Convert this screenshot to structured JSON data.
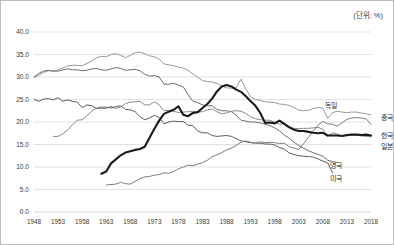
{
  "unit_note": "(단위: %)",
  "chart_data": {
    "type": "line",
    "title": "",
    "subtitle": "",
    "xlabel": "",
    "ylabel": "",
    "unit": "%",
    "xlim": [
      1948,
      2018
    ],
    "ylim": [
      0.0,
      40.0
    ],
    "grid": true,
    "legend_position": "inline-right",
    "x_ticks": [
      "1948",
      "1953",
      "1958",
      "1963",
      "1968",
      "1973",
      "1978",
      "1983",
      "1988",
      "1993",
      "1998",
      "2003",
      "2008",
      "2013",
      "2018"
    ],
    "y_ticks": [
      "0.0",
      "5.0",
      "10.0",
      "15.0",
      "20.0",
      "25.0",
      "30.0",
      "35.0",
      "40.0"
    ],
    "series": [
      {
        "name": "독일",
        "label": "독일",
        "color": "#9a9a9a",
        "width": 1.0,
        "emphasis": false,
        "x": [
          1948,
          1949,
          1950,
          1951,
          1952,
          1953,
          1954,
          1955,
          1956,
          1957,
          1958,
          1959,
          1960,
          1961,
          1962,
          1963,
          1964,
          1965,
          1966,
          1967,
          1968,
          1969,
          1970,
          1971,
          1972,
          1973,
          1974,
          1975,
          1976,
          1977,
          1978,
          1979,
          1980,
          1981,
          1982,
          1983,
          1984,
          1985,
          1986,
          1987,
          1988,
          1989,
          1990,
          1991,
          1992,
          1993,
          1994,
          1995,
          1996,
          1997,
          1998,
          1999,
          2000,
          2001,
          2002,
          2003,
          2004,
          2005,
          2006,
          2007,
          2008,
          2009,
          2010,
          2011,
          2012,
          2013,
          2014,
          2015,
          2016,
          2017,
          2018
        ],
        "y": [
          29.9,
          30.4,
          31.0,
          31.4,
          31.3,
          31.6,
          32.0,
          32.5,
          32.6,
          32.6,
          32.5,
          33.0,
          33.6,
          34.3,
          34.6,
          34.5,
          35.0,
          35.2,
          34.8,
          34.3,
          34.8,
          35.4,
          35.5,
          35.2,
          34.7,
          34.5,
          34.0,
          32.9,
          32.7,
          32.5,
          32.2,
          32.0,
          31.5,
          30.7,
          29.9,
          29.2,
          29.0,
          28.9,
          28.6,
          28.0,
          27.6,
          27.5,
          27.6,
          29.5,
          27.3,
          25.6,
          25.0,
          24.8,
          24.5,
          24.4,
          24.3,
          24.0,
          23.9,
          23.7,
          23.2,
          22.6,
          22.5,
          22.6,
          23.0,
          23.2,
          23.1,
          20.8,
          22.1,
          22.4,
          22.2,
          22.1,
          22.2,
          22.2,
          22.0,
          21.8,
          21.6
        ]
      },
      {
        "name": "영국",
        "label": "영국",
        "color": "#6e6e6e",
        "width": 1.0,
        "emphasis": false,
        "x": [
          1948,
          1949,
          1950,
          1951,
          1952,
          1953,
          1954,
          1955,
          1956,
          1957,
          1958,
          1959,
          1960,
          1961,
          1962,
          1963,
          1964,
          1965,
          1966,
          1967,
          1968,
          1969,
          1970,
          1971,
          1972,
          1973,
          1974,
          1975,
          1976,
          1977,
          1978,
          1979,
          1980,
          1981,
          1982,
          1983,
          1984,
          1985,
          1986,
          1987,
          1988,
          1989,
          1990,
          1991,
          1992,
          1993,
          1994,
          1995,
          1996,
          1997,
          1998,
          1999,
          2000,
          2001,
          2002,
          2003,
          2004,
          2005,
          2006,
          2007,
          2008,
          2009,
          2010,
          2011
        ],
        "y": [
          30.0,
          30.8,
          31.3,
          31.5,
          31.3,
          31.3,
          31.6,
          31.8,
          31.6,
          31.6,
          31.4,
          31.5,
          31.8,
          31.9,
          31.6,
          31.5,
          31.8,
          32.1,
          31.9,
          31.5,
          31.6,
          31.7,
          31.4,
          30.6,
          30.2,
          30.3,
          30.0,
          28.4,
          28.4,
          28.6,
          28.2,
          27.8,
          26.1,
          24.6,
          24.3,
          23.8,
          23.6,
          23.6,
          22.8,
          22.5,
          22.5,
          22.3,
          21.5,
          20.4,
          20.2,
          20.0,
          20.0,
          19.8,
          19.5,
          19.2,
          18.7,
          18.0,
          17.1,
          16.4,
          15.5,
          14.8,
          14.2,
          13.6,
          13.2,
          12.8,
          12.4,
          11.5,
          11.2,
          11.0
        ]
      },
      {
        "name": "일본",
        "label": "일본",
        "color": "#8a8a8a",
        "width": 1.0,
        "emphasis": false,
        "x": [
          1952,
          1953,
          1954,
          1955,
          1956,
          1957,
          1958,
          1959,
          1960,
          1961,
          1962,
          1963,
          1964,
          1965,
          1966,
          1967,
          1968,
          1969,
          1970,
          1971,
          1972,
          1973,
          1974,
          1975,
          1976,
          1977,
          1978,
          1979,
          1980,
          1981,
          1982,
          1983,
          1984,
          1985,
          1986,
          1987,
          1988,
          1989,
          1990,
          1991,
          1992,
          1993,
          1994,
          1995,
          1996,
          1997,
          1998,
          1999,
          2000,
          2001,
          2002,
          2003,
          2004,
          2005,
          2006,
          2007,
          2008,
          2009,
          2010,
          2011,
          2012,
          2013,
          2014,
          2015,
          2016,
          2017,
          2018
        ],
        "y": [
          16.8,
          16.8,
          17.4,
          18.2,
          19.4,
          20.4,
          20.5,
          21.4,
          22.4,
          23.1,
          23.0,
          23.0,
          23.5,
          23.0,
          23.3,
          24.1,
          24.4,
          24.5,
          24.6,
          23.8,
          23.8,
          24.5,
          23.8,
          22.5,
          22.6,
          22.4,
          22.1,
          22.2,
          22.3,
          22.4,
          22.2,
          22.3,
          22.7,
          22.9,
          22.3,
          21.8,
          22.0,
          22.4,
          22.5,
          22.4,
          21.9,
          21.2,
          20.7,
          20.5,
          20.4,
          20.4,
          19.9,
          19.5,
          19.6,
          19.0,
          18.6,
          18.5,
          18.6,
          18.6,
          18.7,
          18.8,
          18.4,
          16.8,
          17.6,
          17.3,
          16.9,
          16.9,
          17.1,
          17.1,
          16.9,
          16.8,
          16.7
        ]
      },
      {
        "name": "미국",
        "label": "미국",
        "color": "#5c5c5c",
        "width": 1.0,
        "emphasis": false,
        "x": [
          1948,
          1949,
          1950,
          1951,
          1952,
          1953,
          1954,
          1955,
          1956,
          1957,
          1958,
          1959,
          1960,
          1961,
          1962,
          1963,
          1964,
          1965,
          1966,
          1967,
          1968,
          1969,
          1970,
          1971,
          1972,
          1973,
          1974,
          1975,
          1976,
          1977,
          1978,
          1979,
          1980,
          1981,
          1982,
          1983,
          1984,
          1985,
          1986,
          1987,
          1988,
          1989,
          1990,
          1991,
          1992,
          1993,
          1994,
          1995,
          1996,
          1997,
          1998,
          1999,
          2000,
          2001,
          2002,
          2003,
          2004,
          2005,
          2006,
          2007,
          2008,
          2009,
          2010
        ],
        "y": [
          25.0,
          24.6,
          25.1,
          25.2,
          24.9,
          25.4,
          24.6,
          24.9,
          24.6,
          24.4,
          23.2,
          23.8,
          23.6,
          23.0,
          23.3,
          23.3,
          23.1,
          23.4,
          23.6,
          22.8,
          22.7,
          22.3,
          21.2,
          20.5,
          20.9,
          21.5,
          21.0,
          19.6,
          20.0,
          20.2,
          20.1,
          20.1,
          19.3,
          19.2,
          18.0,
          17.6,
          17.6,
          17.0,
          16.8,
          16.9,
          17.0,
          16.8,
          16.3,
          15.8,
          15.6,
          15.4,
          15.3,
          15.3,
          15.1,
          15.1,
          14.9,
          14.3,
          14.0,
          13.1,
          12.8,
          12.5,
          12.4,
          12.3,
          12.2,
          11.8,
          11.3,
          10.9,
          8.7
        ]
      },
      {
        "name": "중국",
        "label": "중국",
        "color": "#7d7d7d",
        "width": 1.0,
        "emphasis": false,
        "x": [
          1963,
          1964,
          1965,
          1966,
          1967,
          1968,
          1969,
          1970,
          1971,
          1972,
          1973,
          1974,
          1975,
          1976,
          1977,
          1978,
          1979,
          1980,
          1981,
          1982,
          1983,
          1984,
          1985,
          1986,
          1987,
          1988,
          1989,
          1990,
          1991,
          1992,
          1993,
          1994,
          1995,
          1996,
          1997,
          1998,
          1999,
          2000,
          2001,
          2002,
          2003,
          2004,
          2005,
          2006,
          2007,
          2008,
          2009,
          2010,
          2011,
          2012,
          2013,
          2014,
          2015,
          2016,
          2017,
          2018
        ],
        "y": [
          6.0,
          6.1,
          6.2,
          6.6,
          6.3,
          6.2,
          6.8,
          7.4,
          7.8,
          7.9,
          8.2,
          8.3,
          8.7,
          8.6,
          9.0,
          9.6,
          10.0,
          10.4,
          10.3,
          10.6,
          11.0,
          11.5,
          12.3,
          12.7,
          13.2,
          13.8,
          14.2,
          14.8,
          15.5,
          15.8,
          15.5,
          15.3,
          15.6,
          15.4,
          15.5,
          15.4,
          15.2,
          15.3,
          14.5,
          14.2,
          13.9,
          15.2,
          16.6,
          17.9,
          19.3,
          20.1,
          19.6,
          19.5,
          19.1,
          19.8,
          20.6,
          20.9,
          21.0,
          20.9,
          20.7,
          19.5
        ]
      },
      {
        "name": "한국",
        "label": "한국",
        "color": "#1a1a1a",
        "width": 2.1,
        "emphasis": true,
        "x": [
          1962,
          1963,
          1964,
          1965,
          1966,
          1967,
          1968,
          1969,
          1970,
          1971,
          1972,
          1973,
          1974,
          1975,
          1976,
          1977,
          1978,
          1979,
          1980,
          1981,
          1982,
          1983,
          1984,
          1985,
          1986,
          1987,
          1988,
          1989,
          1990,
          1991,
          1992,
          1993,
          1994,
          1995,
          1996,
          1997,
          1998,
          1999,
          2000,
          2001,
          2002,
          2003,
          2004,
          2005,
          2006,
          2007,
          2008,
          2009,
          2010,
          2011,
          2012,
          2013,
          2014,
          2015,
          2016,
          2017,
          2018
        ],
        "y": [
          8.5,
          9.0,
          10.8,
          11.7,
          12.6,
          13.2,
          13.5,
          13.8,
          14.0,
          14.5,
          16.5,
          18.5,
          20.3,
          21.8,
          22.3,
          22.7,
          23.5,
          21.6,
          21.3,
          22.0,
          22.2,
          23.1,
          24.0,
          25.2,
          26.8,
          27.9,
          28.2,
          27.9,
          27.2,
          26.7,
          25.7,
          24.6,
          23.6,
          22.0,
          19.8,
          19.9,
          19.7,
          20.3,
          19.6,
          18.8,
          18.3,
          18.0,
          18.0,
          17.8,
          17.6,
          17.5,
          17.6,
          17.0,
          17.0,
          17.0,
          16.9,
          17.1,
          17.2,
          17.2,
          17.1,
          17.2,
          17.0
        ]
      }
    ],
    "series_labels": [
      {
        "text": "독일",
        "x": 2008.5,
        "y": 23.6
      },
      {
        "text": "중국",
        "x": 2020.0,
        "y": 21.0
      },
      {
        "text": "한국",
        "x": 2020.0,
        "y": 17.0
      },
      {
        "text": "일본",
        "x": 2020.0,
        "y": 14.6
      },
      {
        "text": "영국",
        "x": 2009.5,
        "y": 10.4
      },
      {
        "text": "미국",
        "x": 2009.5,
        "y": 7.5
      }
    ]
  }
}
